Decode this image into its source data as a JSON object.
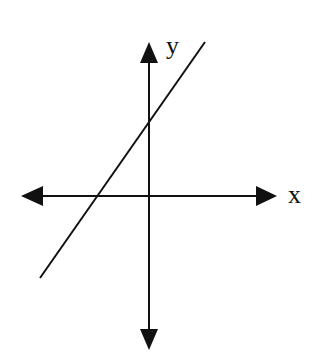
{
  "diagram": {
    "axes": {
      "x_label": "x",
      "y_label": "y",
      "color": "#111111"
    },
    "line": {
      "description": "Straight line with positive slope, positive y-intercept and negative x-intercept",
      "color": "#111111"
    }
  }
}
